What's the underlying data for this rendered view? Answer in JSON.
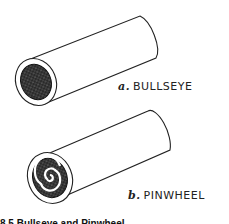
{
  "figure": {
    "panels": [
      {
        "letter": "a.",
        "name": "BULLSEYE",
        "pattern": "solid-core"
      },
      {
        "letter": "b.",
        "name": "PINWHEEL",
        "pattern": "spiral"
      }
    ],
    "caption_partial": "8.5 Bullseye and Pinwheel"
  }
}
